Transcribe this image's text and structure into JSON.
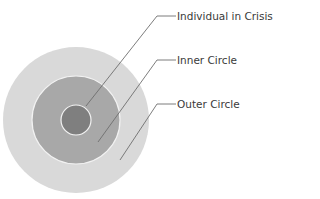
{
  "diagram": {
    "type": "concentric-circles",
    "colors": {
      "outer": "#d9d9d9",
      "inner": "#a8a8a8",
      "center": "#7f7f7f",
      "ring_stroke": "#f2f2f2",
      "leader": "#6e6e6e",
      "text": "#3a3a3a"
    },
    "layers": [
      {
        "id": "center",
        "label": "Individual in Crisis"
      },
      {
        "id": "inner",
        "label": "Inner Circle"
      },
      {
        "id": "outer",
        "label": "Outer Circle"
      }
    ]
  }
}
